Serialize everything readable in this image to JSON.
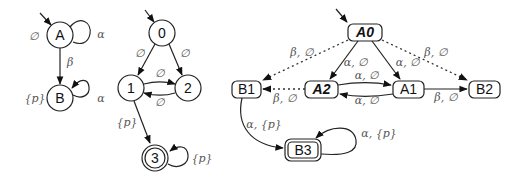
{
  "diagram1": {
    "nodes": {
      "A": "A",
      "B": "B"
    },
    "labels": {
      "A_prop": "∅",
      "A_loop": "α",
      "AB_edge": "β",
      "B_prop": "{p}",
      "B_loop": "α"
    }
  },
  "diagram2": {
    "nodes": {
      "n0": "0",
      "n1": "1",
      "n2": "2",
      "n3": "3"
    },
    "labels": {
      "e01": "∅",
      "e02": "∅",
      "e12": "∅",
      "e21": "∅",
      "e13": "{p}",
      "loop3": "{p}"
    }
  },
  "diagram3": {
    "nodes": {
      "A0": "A0",
      "A1": "A1",
      "A2": "A2",
      "B1": "B1",
      "B2": "B2",
      "B3": "B3"
    },
    "labels": {
      "A0_B1": "β, ∅",
      "A0_B2": "β, ∅",
      "A0_A2": "α, ∅",
      "A0_A1": "α, ∅",
      "A2_A1": "α, ∅",
      "A1_A2": "α, ∅",
      "A2_B1": "β, ∅",
      "A1_B2": "β, ∅",
      "B1_B3": "α, {p}",
      "B3_loop": "α, {p}"
    }
  }
}
